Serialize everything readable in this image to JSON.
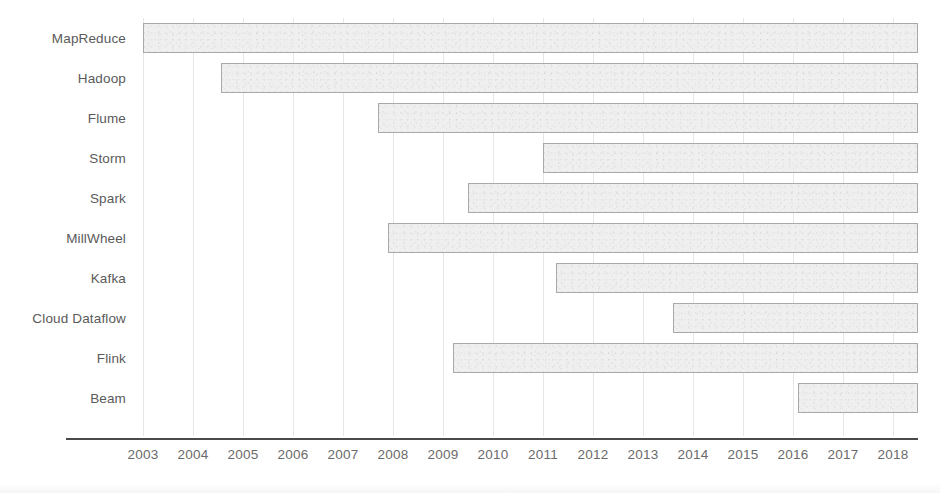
{
  "chart_data": {
    "type": "bar",
    "orientation": "horizontal",
    "subtype": "gantt-timeline",
    "title": "",
    "subtitle": "",
    "xlabel": "",
    "ylabel": "",
    "xlim": [
      2002.6,
      2018.7
    ],
    "grid": true,
    "grid_axis": "x",
    "legend": false,
    "legend_position": "none",
    "axis_line_color": "#4a4a4a",
    "bar_fill_color": "#efefef",
    "bar_border_color": "#a9a9a9",
    "gridline_color": "#e6e6e6",
    "label_color": "#5a5a5a",
    "tick_label_color": "#6a6a6a",
    "categories": [
      "MapReduce",
      "Hadoop",
      "Flume",
      "Storm",
      "Spark",
      "MillWheel",
      "Kafka",
      "Cloud Dataflow",
      "Flink",
      "Beam"
    ],
    "x_ticks": [
      "2003",
      "2004",
      "2005",
      "2006",
      "2007",
      "2008",
      "2009",
      "2010",
      "2011",
      "2012",
      "2013",
      "2014",
      "2015",
      "2016",
      "2017",
      "2018"
    ],
    "x_tick_values": [
      2003,
      2004,
      2005,
      2006,
      2007,
      2008,
      2009,
      2010,
      2011,
      2012,
      2013,
      2014,
      2015,
      2016,
      2017,
      2018
    ],
    "bars": [
      {
        "label": "MapReduce",
        "start": 2003.0,
        "end": 2018.5
      },
      {
        "label": "Hadoop",
        "start": 2004.55,
        "end": 2018.5
      },
      {
        "label": "Flume",
        "start": 2007.7,
        "end": 2018.5
      },
      {
        "label": "Storm",
        "start": 2011.0,
        "end": 2018.5
      },
      {
        "label": "Spark",
        "start": 2009.5,
        "end": 2018.5
      },
      {
        "label": "MillWheel",
        "start": 2007.9,
        "end": 2018.5
      },
      {
        "label": "Kafka",
        "start": 2011.25,
        "end": 2018.5
      },
      {
        "label": "Cloud Dataflow",
        "start": 2013.6,
        "end": 2018.5
      },
      {
        "label": "Flink",
        "start": 2009.2,
        "end": 2018.5
      },
      {
        "label": "Beam",
        "start": 2016.1,
        "end": 2018.5
      }
    ]
  }
}
